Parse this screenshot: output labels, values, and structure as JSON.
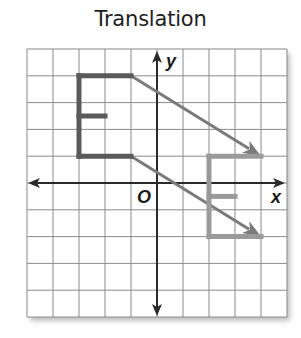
{
  "title": "Translation",
  "axes": {
    "x_label": "x",
    "y_label": "y",
    "origin_label": "O",
    "x_range": [
      -5,
      5
    ],
    "y_range": [
      -5,
      5
    ],
    "grid_step": 1
  },
  "figures": {
    "preimage": {
      "name": "E",
      "color": "#5a5a5a",
      "segments": [
        [
          [
            -1,
            4
          ],
          [
            -3,
            4
          ]
        ],
        [
          [
            -3,
            4
          ],
          [
            -3,
            1
          ]
        ],
        [
          [
            -3,
            1
          ],
          [
            -1,
            1
          ]
        ],
        [
          [
            -3,
            2.5
          ],
          [
            -2,
            2.5
          ]
        ]
      ]
    },
    "image": {
      "name": "E'",
      "color": "#9a9a9a",
      "segments": [
        [
          [
            4,
            1
          ],
          [
            2,
            1
          ]
        ],
        [
          [
            2,
            1
          ],
          [
            2,
            -2
          ]
        ],
        [
          [
            2,
            -2
          ],
          [
            4,
            -2
          ]
        ],
        [
          [
            2,
            -0.5
          ],
          [
            3,
            -0.5
          ]
        ]
      ]
    },
    "translation_arrows": {
      "color": "#7a7a7a",
      "vector": [
        5,
        -3
      ],
      "arrows": [
        {
          "from": [
            -1,
            4
          ],
          "to": [
            4,
            1
          ]
        },
        {
          "from": [
            -1,
            1
          ],
          "to": [
            4,
            -2
          ]
        }
      ]
    }
  },
  "colors": {
    "grid": "#8a8a8a",
    "axis": "#2a2a2a",
    "text": "#1e1e1e"
  }
}
